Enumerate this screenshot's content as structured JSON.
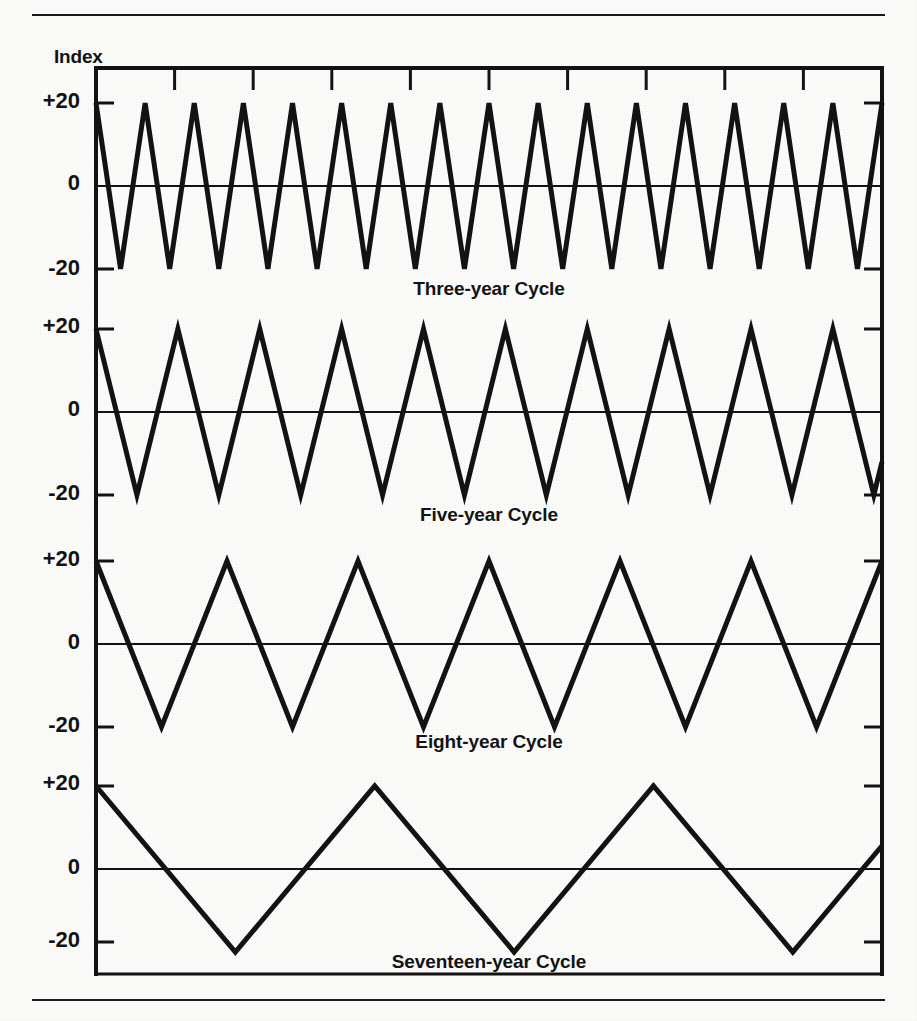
{
  "figure": {
    "axis_title": "Index",
    "background_color": "#fbfbfa",
    "ink_color": "#131313",
    "has_top_rule": true,
    "has_bottom_rule": true
  },
  "chart_data": {
    "type": "line",
    "title": "Index",
    "subtitle": "",
    "xlabel": "",
    "ylabel": "Index",
    "ylim": [
      -28,
      28
    ],
    "yticks": [
      20,
      0,
      -20
    ],
    "ytick_labels": [
      "+20",
      "0",
      "-20"
    ],
    "grid": false,
    "legend_position": "inline-below-each-panel",
    "x_axis_ticks": 9,
    "x_tick_labels": [],
    "waveform": "triangular",
    "amplitude": 20,
    "panel_count": 4,
    "series": [
      {
        "name": "Three-year Cycle",
        "label": "Three-year Cycle",
        "period_years": 3,
        "cycles_shown": 16,
        "amplitude": 20,
        "peak_value": 20,
        "trough_value": -20,
        "starts_at": 20
      },
      {
        "name": "Five-year Cycle",
        "label": "Five-year Cycle",
        "period_years": 5,
        "cycles_shown": 9.6,
        "amplitude": 20,
        "peak_value": 20,
        "trough_value": -20,
        "starts_at": 20
      },
      {
        "name": "Eight-year Cycle",
        "label": "Eight-year Cycle",
        "period_years": 8,
        "cycles_shown": 6.0,
        "amplitude": 20,
        "peak_value": 20,
        "trough_value": -20,
        "starts_at": 20
      },
      {
        "name": "Seventeen-year Cycle",
        "label": "Seventeen-year Cycle",
        "period_years": 17,
        "cycles_shown": 2.82,
        "amplitude": 20,
        "peak_value": 20,
        "trough_value": -20,
        "starts_at": 20
      }
    ]
  },
  "panels": [
    {
      "id": "three-year",
      "label": "Three-year Cycle",
      "ytick_labels": [
        "+20",
        "0",
        "-20"
      ]
    },
    {
      "id": "five-year",
      "label": "Five-year Cycle",
      "ytick_labels": [
        "+20",
        "0",
        "-20"
      ]
    },
    {
      "id": "eight-year",
      "label": "Eight-year Cycle",
      "ytick_labels": [
        "+20",
        "0",
        "-20"
      ]
    },
    {
      "id": "seventeen-year",
      "label": "Seventeen-year Cycle",
      "ytick_labels": [
        "+20",
        "0",
        "-20"
      ]
    }
  ]
}
